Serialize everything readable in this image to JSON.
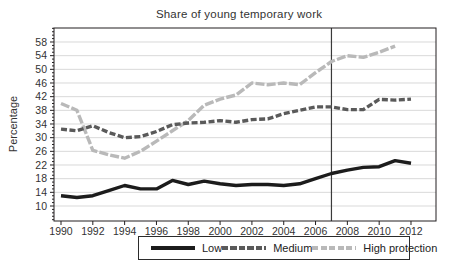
{
  "chart_data": {
    "type": "line",
    "title": "Share of young temporary work",
    "xlabel": "",
    "ylabel": "Percentage",
    "xlim": [
      1990,
      2012
    ],
    "ylim": [
      10,
      58
    ],
    "grid": "horizontal",
    "legend_position": "bottom",
    "reference_line_x": 2007,
    "x_tick_values": [
      1990,
      1992,
      1994,
      1996,
      1998,
      2000,
      2002,
      2004,
      2006,
      2008,
      2010,
      2012
    ],
    "y_tick_values": [
      10,
      14,
      18,
      22,
      26,
      30,
      34,
      38,
      42,
      46,
      50,
      54,
      58
    ],
    "y_minor_tick_step": 1,
    "series": [
      {
        "name": "Low",
        "line_style": "solid",
        "color": "#1c1c1c",
        "years": [
          1990,
          1991,
          1992,
          1993,
          1994,
          1995,
          1996,
          1997,
          1998,
          1999,
          2000,
          2001,
          2002,
          2003,
          2004,
          2005,
          2006,
          2007,
          2008,
          2009,
          2010,
          2011,
          2012
        ],
        "values": [
          13,
          12.5,
          13,
          14.5,
          16,
          15,
          15,
          17.5,
          16.3,
          17.3,
          16.5,
          16,
          16.3,
          16.3,
          16,
          16.5,
          18,
          19.5,
          20.5,
          21.3,
          21.5,
          23.3,
          22.5
        ]
      },
      {
        "name": "Medium",
        "line_style": "dashed",
        "color": "#5a5a5a",
        "years": [
          1990,
          1991,
          1992,
          1993,
          1994,
          1995,
          1996,
          1997,
          1998,
          1999,
          2000,
          2001,
          2002,
          2003,
          2004,
          2005,
          2006,
          2007,
          2008,
          2009,
          2010,
          2011,
          2012
        ],
        "values": [
          32.5,
          32,
          33.5,
          31.5,
          30,
          30.3,
          31.8,
          33.8,
          34.3,
          34.5,
          35,
          34.5,
          35.3,
          35.5,
          37,
          38,
          39,
          39,
          38.2,
          38.2,
          41.2,
          41,
          41.3
        ]
      },
      {
        "name": "High protection",
        "line_style": "dashed",
        "color": "#b9b9b9",
        "years": [
          1990,
          1991,
          1992,
          1993,
          1994,
          1995,
          1996,
          1997,
          1998,
          1999,
          2000,
          2001,
          2002,
          2003,
          2004,
          2005,
          2006,
          2007,
          2008,
          2009,
          2010,
          2011
        ],
        "values": [
          40,
          38,
          26.3,
          25,
          24,
          26,
          29,
          32,
          35,
          39.5,
          41.3,
          42.5,
          46,
          45.5,
          46,
          45.5,
          49,
          52.3,
          54,
          53.5,
          55,
          56.8
        ]
      }
    ],
    "colors": {
      "grid": "#d9d9d9",
      "frame": "#231f20",
      "reference_line": "#3a3a3a",
      "text": "#333333",
      "background": "#ffffff"
    }
  }
}
